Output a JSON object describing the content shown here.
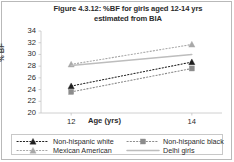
{
  "figure": {
    "title_line1": "Figure 4.3.12: %BF for girls aged 12-14 yrs",
    "title_line2": "estimated from BIA"
  },
  "axes": {
    "y_label": "% BF",
    "x_label": "Age (yrs)",
    "y_ticks": [
      "34",
      "32",
      "30",
      "28",
      "26",
      "24",
      "22",
      "20"
    ],
    "x_ticks": [
      "12",
      "14"
    ]
  },
  "legend": {
    "items": [
      {
        "label": "Non-hispanic white",
        "marker": "triangle-filled-dark",
        "line": "dotted",
        "color": "#1f1f1f"
      },
      {
        "label": "Non-hispanic black",
        "marker": "square-gray",
        "line": "dotted",
        "color": "#8c8c8c"
      },
      {
        "label": "Mexican American",
        "marker": "triangle-light",
        "line": "dotted",
        "color": "#a8a8a8"
      },
      {
        "label": "Delhi girls",
        "marker": "none",
        "line": "solid",
        "color": "#bdbdbd"
      }
    ]
  },
  "chart_data": {
    "type": "line",
    "title": "Figure 4.3.12: %BF for girls aged 12-14 yrs estimated from BIA",
    "xlabel": "Age (yrs)",
    "ylabel": "% BF",
    "x": [
      12,
      14
    ],
    "xlim": [
      11.5,
      14.5
    ],
    "ylim": [
      20,
      34
    ],
    "y_ticks": [
      20,
      22,
      24,
      26,
      28,
      30,
      32,
      34
    ],
    "grid": false,
    "legend_position": "bottom",
    "series": [
      {
        "name": "Non-hispanic white",
        "values": [
          24.6,
          28.7
        ],
        "marker": "triangle",
        "linestyle": "dotted",
        "color": "#1f1f1f"
      },
      {
        "name": "Non-hispanic black",
        "values": [
          23.6,
          27.6
        ],
        "marker": "square",
        "linestyle": "dotted",
        "color": "#8c8c8c"
      },
      {
        "name": "Mexican American",
        "values": [
          28.3,
          31.7
        ],
        "marker": "triangle",
        "linestyle": "dotted",
        "color": "#a8a8a8"
      },
      {
        "name": "Delhi girls",
        "values": [
          28.1,
          30.0
        ],
        "marker": "none",
        "linestyle": "solid",
        "color": "#bdbdbd"
      }
    ]
  }
}
